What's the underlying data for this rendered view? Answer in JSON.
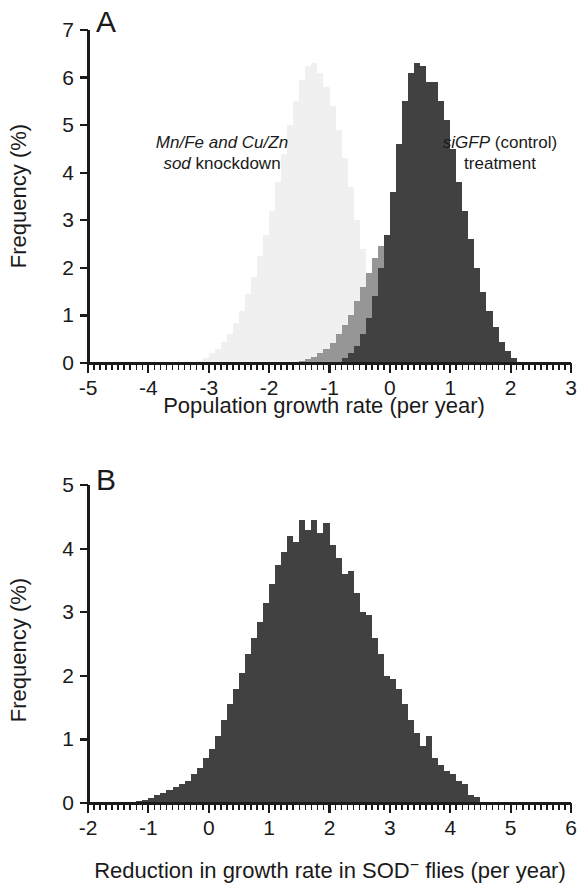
{
  "figure": {
    "panels": [
      "A",
      "B"
    ],
    "background": "#ffffff"
  },
  "panel_a": {
    "letter": "A",
    "xlabel": "Population growth rate (per year)",
    "ylabel": "Frequency (%)",
    "annotation_left_line1": "Mn/Fe and Cu/Zn",
    "annotation_left_line2_italic": "sod",
    "annotation_left_line2_rest": " knockdown",
    "annotation_right_line1_italic": "siGFP",
    "annotation_right_line1_rest": " (control)",
    "annotation_right_line2": "treatment",
    "xticks": [
      "-5",
      "-4",
      "-3",
      "-2",
      "-1",
      "0",
      "1",
      "2",
      "3"
    ],
    "yticks": [
      "0",
      "1",
      "2",
      "3",
      "4",
      "5",
      "6",
      "7"
    ],
    "colors": {
      "knockdown": "#f0f0f0",
      "overlap": "#969696",
      "control": "#414141",
      "axis": "#1a1a1a"
    }
  },
  "panel_b": {
    "letter": "B",
    "xlabel_part1": "Reduction in growth rate in SOD",
    "xlabel_superscript": "−",
    "xlabel_part2": " flies (per year)",
    "ylabel": "Frequency (%)",
    "xticks": [
      "-2",
      "-1",
      "0",
      "1",
      "2",
      "3",
      "4",
      "5",
      "6"
    ],
    "yticks": [
      "0",
      "1",
      "2",
      "3",
      "4",
      "5"
    ],
    "colors": {
      "bars": "#414141",
      "axis": "#1a1a1a"
    }
  },
  "chart_data": [
    {
      "type": "bar",
      "panel": "A",
      "title": "",
      "xlabel": "Population growth rate (per year)",
      "ylabel": "Frequency (%)",
      "xlim": [
        -5,
        3
      ],
      "ylim": [
        0,
        7
      ],
      "xticks": [
        -5,
        -4,
        -3,
        -2,
        -1,
        0,
        1,
        2,
        3
      ],
      "yticks": [
        0,
        1,
        2,
        3,
        4,
        5,
        6,
        7
      ],
      "minor_tick_step": 0.1,
      "grid": false,
      "legend": "annotations",
      "bin_width": 0.1,
      "series": [
        {
          "name": "Mn/Fe and Cu/Zn sod knockdown",
          "color": "#f0f0f0",
          "bin_starts": [
            -3.2,
            -3.1,
            -3.0,
            -2.9,
            -2.8,
            -2.7,
            -2.6,
            -2.5,
            -2.4,
            -2.3,
            -2.2,
            -2.1,
            -2.0,
            -1.9,
            -1.8,
            -1.7,
            -1.6,
            -1.5,
            -1.4,
            -1.3,
            -1.2,
            -1.1,
            -1.0,
            -0.9,
            -0.8,
            -0.7,
            -0.6,
            -0.5,
            -0.4,
            -0.3,
            -0.2,
            -0.1,
            0.0
          ],
          "values": [
            0.05,
            0.1,
            0.2,
            0.3,
            0.45,
            0.6,
            0.85,
            1.1,
            1.45,
            1.8,
            2.25,
            2.7,
            3.2,
            3.8,
            4.4,
            5.0,
            5.5,
            5.95,
            6.25,
            6.3,
            6.1,
            5.8,
            5.4,
            4.9,
            4.3,
            3.7,
            3.0,
            2.4,
            1.8,
            1.25,
            0.8,
            0.4,
            0.15
          ]
        },
        {
          "name": "overlap region",
          "color": "#969696",
          "bin_starts": [
            -1.6,
            -1.5,
            -1.4,
            -1.3,
            -1.2,
            -1.1,
            -1.0,
            -0.9,
            -0.8,
            -0.7,
            -0.6,
            -0.5,
            -0.4,
            -0.3,
            -0.2,
            -0.1,
            0.0
          ],
          "values": [
            0.03,
            0.05,
            0.08,
            0.12,
            0.2,
            0.3,
            0.42,
            0.6,
            0.8,
            1.0,
            1.3,
            1.6,
            1.9,
            2.2,
            2.45,
            2.6,
            2.7
          ]
        },
        {
          "name": "siGFP (control) treatment",
          "color": "#414141",
          "bin_starts": [
            -0.8,
            -0.7,
            -0.6,
            -0.5,
            -0.4,
            -0.3,
            -0.2,
            -0.1,
            0.0,
            0.1,
            0.2,
            0.3,
            0.4,
            0.5,
            0.6,
            0.7,
            0.8,
            0.9,
            1.0,
            1.1,
            1.2,
            1.3,
            1.4,
            1.5,
            1.6,
            1.7,
            1.8,
            1.9,
            2.0
          ],
          "values": [
            0.1,
            0.2,
            0.35,
            0.6,
            0.95,
            1.4,
            2.0,
            2.7,
            3.6,
            4.6,
            5.5,
            6.1,
            6.3,
            6.25,
            5.9,
            5.9,
            5.5,
            5.1,
            4.5,
            3.8,
            3.2,
            2.6,
            2.0,
            1.5,
            1.1,
            0.75,
            0.45,
            0.25,
            0.1
          ]
        }
      ]
    },
    {
      "type": "bar",
      "panel": "B",
      "title": "",
      "xlabel": "Reduction in growth rate in SOD− flies (per year)",
      "ylabel": "Frequency (%)",
      "xlim": [
        -2,
        6
      ],
      "ylim": [
        0,
        5
      ],
      "xticks": [
        -2,
        -1,
        0,
        1,
        2,
        3,
        4,
        5,
        6
      ],
      "yticks": [
        0,
        1,
        2,
        3,
        4,
        5
      ],
      "minor_tick_step": 0.1,
      "grid": false,
      "bin_width": 0.1,
      "series": [
        {
          "name": "Reduction in growth rate",
          "color": "#414141",
          "bin_starts": [
            -1.2,
            -1.1,
            -1.0,
            -0.9,
            -0.8,
            -0.7,
            -0.6,
            -0.5,
            -0.4,
            -0.3,
            -0.2,
            -0.1,
            0.0,
            0.1,
            0.2,
            0.3,
            0.4,
            0.5,
            0.6,
            0.7,
            0.8,
            0.9,
            1.0,
            1.1,
            1.2,
            1.3,
            1.4,
            1.5,
            1.6,
            1.7,
            1.8,
            1.9,
            2.0,
            2.1,
            2.2,
            2.3,
            2.4,
            2.5,
            2.6,
            2.7,
            2.8,
            2.9,
            3.0,
            3.1,
            3.2,
            3.3,
            3.4,
            3.5,
            3.6,
            3.7,
            3.8,
            3.9,
            4.0,
            4.1,
            4.2,
            4.3,
            4.4
          ],
          "values": [
            0.03,
            0.05,
            0.08,
            0.12,
            0.15,
            0.2,
            0.25,
            0.3,
            0.35,
            0.45,
            0.55,
            0.7,
            0.85,
            1.05,
            1.3,
            1.55,
            1.8,
            2.05,
            2.35,
            2.6,
            2.85,
            3.15,
            3.45,
            3.75,
            3.95,
            4.2,
            4.1,
            4.45,
            4.3,
            4.45,
            4.25,
            4.4,
            4.05,
            3.85,
            3.6,
            3.65,
            3.3,
            3.0,
            2.95,
            2.6,
            2.35,
            2.0,
            1.95,
            1.8,
            1.55,
            1.3,
            1.1,
            0.9,
            1.05,
            0.7,
            0.6,
            0.5,
            0.45,
            0.35,
            0.3,
            0.12,
            0.1
          ]
        }
      ]
    }
  ]
}
